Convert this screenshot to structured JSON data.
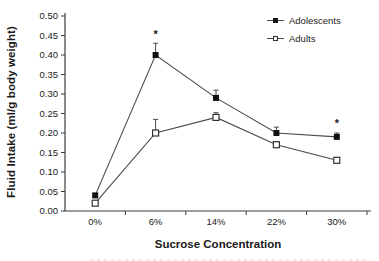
{
  "chart_data": {
    "type": "line",
    "title": "",
    "categories": [
      "0%",
      "6%",
      "14%",
      "22%",
      "30%"
    ],
    "series": [
      {
        "name": "Adolescents",
        "marker": "filled-square",
        "values": [
          0.04,
          0.4,
          0.29,
          0.2,
          0.19
        ],
        "errors_upper": [
          0,
          0.03,
          0.02,
          0.015,
          0.01
        ]
      },
      {
        "name": "Adults",
        "marker": "open-square",
        "values": [
          0.02,
          0.2,
          0.24,
          0.17,
          0.13
        ],
        "errors_upper": [
          0,
          0.035,
          0.012,
          0.008,
          0
        ]
      }
    ],
    "annotations": [
      {
        "symbol": "*",
        "category": "6%",
        "y": 0.455
      },
      {
        "symbol": "*",
        "category": "30%",
        "y": 0.225
      }
    ],
    "xlabel": "Sucrose Concentration",
    "ylabel": "Fluid Intake (ml/g body weight)",
    "ylim": [
      0,
      0.5
    ],
    "ytick_step": 0.05,
    "ytick_decimals": 2,
    "grid": false,
    "legend_position": "top-right",
    "line_color": "#4a4a4a",
    "marker_fill": "#111111",
    "marker_stroke": "#333333",
    "axis_color": "#3a3a3a",
    "text_color": "#1a1a1a"
  }
}
